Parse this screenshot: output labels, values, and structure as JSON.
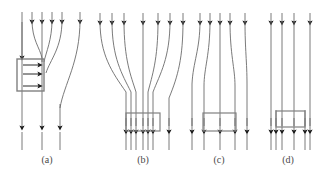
{
  "figure": {
    "type": "technical-line-diagram",
    "background_color": "#ffffff",
    "line_color": "#6b6b6b",
    "box_color": "#808080",
    "arrow_color": "#1a1a1a",
    "width": 326,
    "height": 179,
    "panel_count": 4
  },
  "captions": [
    {
      "label": "(a)",
      "x": 47
    },
    {
      "label": "(b)",
      "x": 143
    },
    {
      "label": "(c)",
      "x": 219
    },
    {
      "label": "(d)",
      "x": 288
    }
  ],
  "panels": [
    {
      "id": "panel-a",
      "caption": "(a)",
      "top_line_count": 6,
      "bottom_line_count": 3,
      "box_count": 1,
      "internal_arrow_count": 3,
      "description": "Six downward vertical lines at top; three curve rightward and terminate at a tall rectangular box with three rightward arrows inside; three lines continue downward."
    },
    {
      "id": "panel-b",
      "caption": "(b)",
      "top_line_count": 7,
      "bottom_line_count": 7,
      "box_count": 1,
      "internal_arrow_count": 0,
      "description": "Seven widely spread lines at top converge inward into a narrow rectangular box near the bottom, then continue downward closely spaced."
    },
    {
      "id": "panel-c",
      "caption": "(c)",
      "top_line_count": 5,
      "bottom_line_count": 5,
      "box_count": 1,
      "internal_arrow_count": 0,
      "description": "Five lines spread outward then converge; a box spans the centre three lines near the bottom."
    },
    {
      "id": "panel-d",
      "caption": "(d)",
      "top_line_count": 4,
      "bottom_line_count": 5,
      "box_count": 1,
      "internal_arrow_count": 0,
      "description": "Four straight vertical lines with a wide flat box near the bottom spanning the middle region; five arrow terminations below."
    }
  ]
}
